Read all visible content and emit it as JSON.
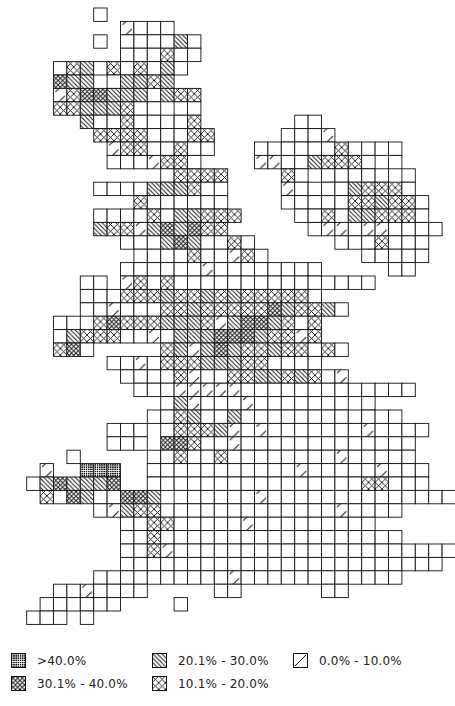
{
  "chart_data": {
    "type": "heatmap",
    "title": "",
    "subtitle": "",
    "grid": {
      "cell_px": 13.4,
      "origin_x": 13.3,
      "origin_y": 8
    },
    "codes": {
      ".": "none",
      "o": "no data / blank",
      "a": "0.0% - 10.0%",
      "b": "10.1% - 20.0%",
      "c": "20.1% - 30.0%",
      "d": "30.1% - 40.0%",
      "e": ">40.0%"
    },
    "rows": [
      "......o..........................",
      "........aooo.....................",
      "......o.ooooco...................",
      "........oooboo...................",
      "...obcoboboco....................",
      "...dcc.occbc.....................",
      "...abddcccocbb...................",
      "...bbcccboo.oo.....................",
      ".....cooboooob.......oo.........",
      "......bbbbooobb.....oooa........",
      ".......abbooboo...ooooooboooo...",
      ".......oooabbo....aaoocbbbo.o...",
      "...........obbbb....bo.ooooo.o..",
      "......oooocccboo....aoooocbbbo..",
      ".........boooooo....ooooobbcbbo.",
      "......ooooboccbbb....ooboccbbbo.",
      "......cbbacdcdbb......oaaoaaoooo",
      "........ooocdcoobo......ooobooo.",
      ".........oooobooabo.......ooooo.",
      "........ooooooaoooooooo.....oo..",
      ".....oo.abobooooooooooooooo.....",
      ".....ooobbbcbbcbcbbbbbo.........",
      ".....ooaooobbcbbbbbdcbbco......",
      "...oo.bdbbbcccbacddcbob........",
      "...ocbbbooaocccdddcbbab........",
      "...bdo.....bcacdcbbcbbobo.......",
      ".......ooaobbbcccbboooo........",
      "........oooobaoobbccbcboa.......",
      ".........oooaaaaaooooooooooooo..",
      "...........ocaoooaooooooo.o.....",
      "..........oobcoocoooooooooooo...",
      ".......ooo.obbbcaoaoooooooaoooo..",
      ".......ooo.ddbooaooooooooooooo..",
      "....o.....ooboobooooooooaooooo...",
      "..a..eee..oooooooooooaoooooaooo..",
      ".ocdcccd..oooooooooooooooobbooo..",
      "..bodcooddc.ooooooaoooooooooooooo",
      "......oacbboooooooooooooaoooo....",
      "........oobboooooaooooooooo......",
      "........ooboooooooooooooooooo....",
      "........oobaooooooooooooooooooooo",
      "........oooooooooooooooooooooooo.",
      "......ooooooooooaoooooooooooo....",
      "...ooaoooo.....oo......oo........",
      "..oooooo....o....................",
      ".ooo.o...........................",
      "................................."
    ],
    "legend": [
      {
        "code": "e",
        "label": ">40.0%",
        "pattern": "dense-dots"
      },
      {
        "code": "d",
        "label": "30.1% - 40.0%",
        "pattern": "dense-cross"
      },
      {
        "code": "c",
        "label": "20.1% - 30.0%",
        "pattern": "dense-diagonal"
      },
      {
        "code": "b",
        "label": "10.1% - 20.0%",
        "pattern": "cross"
      },
      {
        "code": "a",
        "label": "0.0% - 10.0%",
        "pattern": "single-diagonal"
      }
    ],
    "legend_position": "bottom"
  },
  "legend": {
    "items": [
      {
        "label": ">40.0%"
      },
      {
        "label": "30.1% - 40.0%"
      },
      {
        "label": "20.1% - 30.0%"
      },
      {
        "label": "10.1% - 20.0%"
      },
      {
        "label": "0.0% - 10.0%"
      }
    ]
  }
}
